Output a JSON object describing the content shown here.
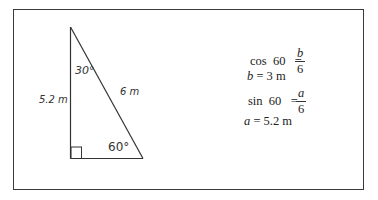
{
  "triangle": {
    "vertices": {
      "apex": [
        70,
        27
      ],
      "right_angle": [
        70,
        158
      ],
      "base_right": [
        143,
        158
      ]
    },
    "labels": {
      "vertical_side": "5.2  m",
      "hypotenuse": "6 m",
      "top_angle": "30°",
      "bottom_angle": "60°"
    },
    "right_angle_marker": true
  },
  "equations": {
    "line1": {
      "func": "cos",
      "arg": "60",
      "eq": "=",
      "numerator": "b",
      "denominator": "6"
    },
    "line2": {
      "var": "b",
      "eq": "=",
      "value": "3 m"
    },
    "line3": {
      "func": "sin",
      "arg": "60",
      "eq": "=",
      "numerator": "a",
      "denominator": "6"
    },
    "line4": {
      "var": "a",
      "eq": "=",
      "value": "5.2 m"
    }
  }
}
